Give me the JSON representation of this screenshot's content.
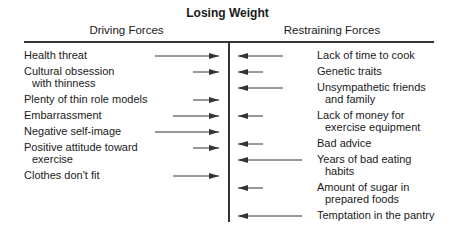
{
  "title": "Losing Weight",
  "headers": {
    "driving": "Driving Forces",
    "restraining": "Restraining Forces"
  },
  "driving_forces": [
    {
      "line1": "Health threat",
      "line2": "",
      "y": 49,
      "arrow_start": 155
    },
    {
      "line1": "Cultural obsession",
      "line2": "with thinness",
      "y": 65,
      "arrow_start": 193
    },
    {
      "line1": "Plenty of thin role models",
      "line2": "",
      "y": 93,
      "arrow_start": 193
    },
    {
      "line1": "Embarrassment",
      "line2": "",
      "y": 109,
      "arrow_start": 173
    },
    {
      "line1": "Negative self-image",
      "line2": "",
      "y": 125,
      "arrow_start": 155
    },
    {
      "line1": "Positive attitude toward",
      "line2": "exercise",
      "y": 141,
      "arrow_start": 193
    },
    {
      "line1": "Clothes don't fit",
      "line2": "",
      "y": 169,
      "arrow_start": 173
    }
  ],
  "restraining_forces": [
    {
      "line1": "Lack of time to cook",
      "line2": "",
      "y": 49,
      "arrow_end": 283
    },
    {
      "line1": "Genetic traits",
      "line2": "",
      "y": 65,
      "arrow_end": 263
    },
    {
      "line1": "Unsympathetic friends",
      "line2": "and family",
      "y": 81,
      "arrow_end": 283
    },
    {
      "line1": "Lack of money for",
      "line2": "exercise equipment",
      "y": 109,
      "arrow_end": 263
    },
    {
      "line1": "Bad advice",
      "line2": "",
      "y": 137,
      "arrow_end": 263
    },
    {
      "line1": "Years of bad eating",
      "line2": "habits",
      "y": 153,
      "arrow_end": 302
    },
    {
      "line1": "Amount of sugar in",
      "line2": "prepared foods",
      "y": 181,
      "arrow_end": 263
    },
    {
      "line1": "Temptation in the pantry",
      "line2": "",
      "y": 209,
      "arrow_end": 302
    }
  ],
  "colors": {
    "line": "#333333",
    "text": "#1a1a1a",
    "background": "#ffffff"
  }
}
